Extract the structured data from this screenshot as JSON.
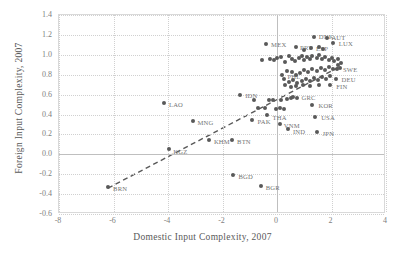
{
  "chart_data": {
    "type": "scatter",
    "title": "",
    "xlabel": "Domestic Input Complexity, 2007",
    "ylabel": "Foreign Input Complexity, 2007",
    "xlim": [
      -8,
      4
    ],
    "ylim": [
      -0.6,
      1.4
    ],
    "xticks": [
      "-8",
      "-6",
      "-4",
      "-2",
      "0",
      "2",
      "4"
    ],
    "xtick_values": [
      -8,
      -6,
      -4,
      -2,
      0,
      2,
      4
    ],
    "yticks": [
      "-0.6",
      "-0.4",
      "-0.2",
      "0.0",
      "0.2",
      "0.4",
      "0.6",
      "0.8",
      "1.0",
      "1.2",
      "1.4"
    ],
    "ytick_values": [
      -0.6,
      -0.4,
      -0.2,
      0.0,
      0.2,
      0.4,
      0.6,
      0.8,
      1.0,
      1.2,
      1.4
    ],
    "grid": true,
    "legend": false,
    "marker_color": "#595959",
    "label_color": "#737373",
    "grid_color": "#d0d0d0",
    "frame_color": "#d9d9d9",
    "trendline": {
      "style": "dashed",
      "color": "#595959",
      "x0": -6.2,
      "y0": -0.34,
      "x1": 2.3,
      "y1": 0.88
    },
    "points": [
      {
        "label": "BRN",
        "x": -6.2,
        "y": -0.33,
        "dx": 5,
        "dy": 2
      },
      {
        "label": "LAO",
        "x": -4.15,
        "y": 0.52,
        "dx": 5,
        "dy": 2
      },
      {
        "label": "KGZ",
        "x": -3.95,
        "y": 0.05,
        "dx": 4,
        "dy": 3
      },
      {
        "label": "MNG",
        "x": -3.1,
        "y": 0.33,
        "dx": 5,
        "dy": 2
      },
      {
        "label": "KHM",
        "x": -2.5,
        "y": 0.14,
        "dx": 5,
        "dy": 2
      },
      {
        "label": "BTN",
        "x": -1.65,
        "y": 0.14,
        "dx": 5,
        "dy": 2
      },
      {
        "label": "IDN",
        "x": -1.35,
        "y": 0.6,
        "dx": 5,
        "dy": 1
      },
      {
        "label": "BGD",
        "x": -1.6,
        "y": -0.21,
        "dx": 5,
        "dy": 2
      },
      {
        "label": "BGR",
        "x": -0.6,
        "y": -0.32,
        "dx": 5,
        "dy": 2
      },
      {
        "label": "PAK",
        "x": -0.9,
        "y": 0.34,
        "dx": 5,
        "dy": 2
      },
      {
        "label": "THA",
        "x": -0.35,
        "y": 0.39,
        "dx": 5,
        "dy": 3
      },
      {
        "label": "MEX",
        "x": -0.4,
        "y": 1.11,
        "dx": 5,
        "dy": 1
      },
      {
        "label": "VNM",
        "x": 0.1,
        "y": 0.3,
        "dx": 4,
        "dy": 2
      },
      {
        "label": "IND",
        "x": 0.4,
        "y": 0.25,
        "dx": 5,
        "dy": 3
      },
      {
        "label": "GRC",
        "x": 0.75,
        "y": 0.57,
        "dx": 4,
        "dy": 0
      },
      {
        "label": "KOR",
        "x": 1.3,
        "y": 0.5,
        "dx": 6,
        "dy": 1
      },
      {
        "label": "USA",
        "x": 1.4,
        "y": 0.37,
        "dx": 6,
        "dy": 1
      },
      {
        "label": "JPN",
        "x": 1.45,
        "y": 0.22,
        "dx": 6,
        "dy": 2
      },
      {
        "label": "PHL",
        "x": 0.2,
        "y": 0.8,
        "dx": 5,
        "dy": 2
      },
      {
        "label": "PRT",
        "x": 0.7,
        "y": 1.08,
        "dx": 4,
        "dy": 1
      },
      {
        "label": "ESP",
        "x": 1.25,
        "y": 1.07,
        "dx": 5,
        "dy": 1
      },
      {
        "label": "DNK",
        "x": 1.35,
        "y": 1.18,
        "dx": 5,
        "dy": 0
      },
      {
        "label": "AUT",
        "x": 1.85,
        "y": 1.17,
        "dx": 4,
        "dy": 0
      },
      {
        "label": "LUX",
        "x": 2.05,
        "y": 1.12,
        "dx": 6,
        "dy": 1
      },
      {
        "label": "SWE",
        "x": 2.2,
        "y": 0.86,
        "dx": 6,
        "dy": 1
      },
      {
        "label": "DEU",
        "x": 2.15,
        "y": 0.76,
        "dx": 6,
        "dy": 1
      },
      {
        "label": "FIN",
        "x": 1.95,
        "y": 0.7,
        "dx": 6,
        "dy": 2
      },
      {
        "label": "",
        "x": -0.55,
        "y": 0.95,
        "dx": 0,
        "dy": 0
      },
      {
        "label": "",
        "x": -0.85,
        "y": 0.55,
        "dx": 0,
        "dy": 0
      },
      {
        "label": "",
        "x": -0.7,
        "y": 0.47,
        "dx": 0,
        "dy": 0
      },
      {
        "label": "",
        "x": -0.45,
        "y": 0.47,
        "dx": 0,
        "dy": 0
      },
      {
        "label": "",
        "x": -0.3,
        "y": 0.55,
        "dx": 0,
        "dy": 0
      },
      {
        "label": "",
        "x": -0.15,
        "y": 0.55,
        "dx": 0,
        "dy": 0
      },
      {
        "label": "",
        "x": -0.05,
        "y": 0.46,
        "dx": 0,
        "dy": 0
      },
      {
        "label": "",
        "x": 0.1,
        "y": 0.47,
        "dx": 0,
        "dy": 0
      },
      {
        "label": "",
        "x": 0.25,
        "y": 0.46,
        "dx": 0,
        "dy": 0
      },
      {
        "label": "",
        "x": 0.15,
        "y": 0.55,
        "dx": 0,
        "dy": 0
      },
      {
        "label": "",
        "x": 0.35,
        "y": 0.56,
        "dx": 0,
        "dy": 0
      },
      {
        "label": "",
        "x": 0.5,
        "y": 0.57,
        "dx": 0,
        "dy": 0
      },
      {
        "label": "",
        "x": 0.6,
        "y": 0.58,
        "dx": 0,
        "dy": 0
      },
      {
        "label": "",
        "x": -0.25,
        "y": 0.96,
        "dx": 0,
        "dy": 0
      },
      {
        "label": "",
        "x": -0.1,
        "y": 0.95,
        "dx": 0,
        "dy": 0
      },
      {
        "label": "",
        "x": 0.0,
        "y": 0.97,
        "dx": 0,
        "dy": 0
      },
      {
        "label": "",
        "x": 0.15,
        "y": 0.98,
        "dx": 0,
        "dy": 0
      },
      {
        "label": "",
        "x": 0.3,
        "y": 0.93,
        "dx": 0,
        "dy": 0
      },
      {
        "label": "",
        "x": 0.45,
        "y": 0.99,
        "dx": 0,
        "dy": 0
      },
      {
        "label": "",
        "x": 0.55,
        "y": 0.96,
        "dx": 0,
        "dy": 0
      },
      {
        "label": "",
        "x": 0.65,
        "y": 0.94,
        "dx": 0,
        "dy": 0
      },
      {
        "label": "",
        "x": 0.8,
        "y": 0.97,
        "dx": 0,
        "dy": 0
      },
      {
        "label": "",
        "x": 0.9,
        "y": 0.99,
        "dx": 0,
        "dy": 0
      },
      {
        "label": "",
        "x": 1.0,
        "y": 0.95,
        "dx": 0,
        "dy": 0
      },
      {
        "label": "",
        "x": 1.1,
        "y": 0.98,
        "dx": 0,
        "dy": 0
      },
      {
        "label": "",
        "x": 1.2,
        "y": 0.96,
        "dx": 0,
        "dy": 0
      },
      {
        "label": "",
        "x": 1.3,
        "y": 0.99,
        "dx": 0,
        "dy": 0
      },
      {
        "label": "",
        "x": 1.45,
        "y": 0.97,
        "dx": 0,
        "dy": 0
      },
      {
        "label": "",
        "x": 1.55,
        "y": 1.0,
        "dx": 0,
        "dy": 0
      },
      {
        "label": "",
        "x": 1.65,
        "y": 0.96,
        "dx": 0,
        "dy": 0
      },
      {
        "label": "",
        "x": 1.75,
        "y": 0.98,
        "dx": 0,
        "dy": 0
      },
      {
        "label": "",
        "x": 1.9,
        "y": 0.95,
        "dx": 0,
        "dy": 0
      },
      {
        "label": "",
        "x": 2.0,
        "y": 0.97,
        "dx": 0,
        "dy": 0
      },
      {
        "label": "",
        "x": 2.1,
        "y": 0.94,
        "dx": 0,
        "dy": 0
      },
      {
        "label": "",
        "x": 2.25,
        "y": 0.96,
        "dx": 0,
        "dy": 0
      },
      {
        "label": "",
        "x": 2.35,
        "y": 0.92,
        "dx": 0,
        "dy": 0
      },
      {
        "label": "",
        "x": 1.0,
        "y": 1.05,
        "dx": 0,
        "dy": 0
      },
      {
        "label": "",
        "x": 1.55,
        "y": 1.08,
        "dx": 0,
        "dy": 0
      },
      {
        "label": "",
        "x": 1.7,
        "y": 1.06,
        "dx": 0,
        "dy": 0
      },
      {
        "label": "",
        "x": 0.35,
        "y": 0.84,
        "dx": 0,
        "dy": 0
      },
      {
        "label": "",
        "x": 0.55,
        "y": 0.83,
        "dx": 0,
        "dy": 0
      },
      {
        "label": "",
        "x": 0.7,
        "y": 0.8,
        "dx": 0,
        "dy": 0
      },
      {
        "label": "",
        "x": 0.85,
        "y": 0.82,
        "dx": 0,
        "dy": 0
      },
      {
        "label": "",
        "x": 1.0,
        "y": 0.85,
        "dx": 0,
        "dy": 0
      },
      {
        "label": "",
        "x": 1.15,
        "y": 0.83,
        "dx": 0,
        "dy": 0
      },
      {
        "label": "",
        "x": 1.3,
        "y": 0.86,
        "dx": 0,
        "dy": 0
      },
      {
        "label": "",
        "x": 1.45,
        "y": 0.84,
        "dx": 0,
        "dy": 0
      },
      {
        "label": "",
        "x": 1.6,
        "y": 0.87,
        "dx": 0,
        "dy": 0
      },
      {
        "label": "",
        "x": 1.75,
        "y": 0.85,
        "dx": 0,
        "dy": 0
      },
      {
        "label": "",
        "x": 1.9,
        "y": 0.88,
        "dx": 0,
        "dy": 0
      },
      {
        "label": "",
        "x": 2.05,
        "y": 0.86,
        "dx": 0,
        "dy": 0
      },
      {
        "label": "",
        "x": 0.25,
        "y": 0.76,
        "dx": 0,
        "dy": 0
      },
      {
        "label": "",
        "x": 0.45,
        "y": 0.73,
        "dx": 0,
        "dy": 0
      },
      {
        "label": "",
        "x": 0.6,
        "y": 0.75,
        "dx": 0,
        "dy": 0
      },
      {
        "label": "",
        "x": 0.75,
        "y": 0.72,
        "dx": 0,
        "dy": 0
      },
      {
        "label": "",
        "x": 0.9,
        "y": 0.74,
        "dx": 0,
        "dy": 0
      },
      {
        "label": "",
        "x": 1.05,
        "y": 0.76,
        "dx": 0,
        "dy": 0
      },
      {
        "label": "",
        "x": 1.2,
        "y": 0.74,
        "dx": 0,
        "dy": 0
      },
      {
        "label": "",
        "x": 1.35,
        "y": 0.77,
        "dx": 0,
        "dy": 0
      },
      {
        "label": "",
        "x": 1.5,
        "y": 0.75,
        "dx": 0,
        "dy": 0
      },
      {
        "label": "",
        "x": 1.65,
        "y": 0.78,
        "dx": 0,
        "dy": 0
      },
      {
        "label": "",
        "x": 1.8,
        "y": 0.76,
        "dx": 0,
        "dy": 0
      },
      {
        "label": "",
        "x": 1.95,
        "y": 0.79,
        "dx": 0,
        "dy": 0
      },
      {
        "label": "",
        "x": 0.3,
        "y": 0.7,
        "dx": 0,
        "dy": 0
      },
      {
        "label": "",
        "x": 0.5,
        "y": 0.68,
        "dx": 0,
        "dy": 0
      },
      {
        "label": "",
        "x": 0.7,
        "y": 0.69,
        "dx": 0,
        "dy": 0
      },
      {
        "label": "",
        "x": 0.95,
        "y": 0.7,
        "dx": 0,
        "dy": 0
      },
      {
        "label": "",
        "x": 1.2,
        "y": 0.69,
        "dx": 0,
        "dy": 0
      },
      {
        "label": "",
        "x": 1.55,
        "y": 0.7,
        "dx": 0,
        "dy": 0
      },
      {
        "label": "",
        "x": 2.25,
        "y": 0.9,
        "dx": 0,
        "dy": 0
      },
      {
        "label": "",
        "x": 2.3,
        "y": 0.87,
        "dx": 0,
        "dy": 0
      }
    ]
  }
}
